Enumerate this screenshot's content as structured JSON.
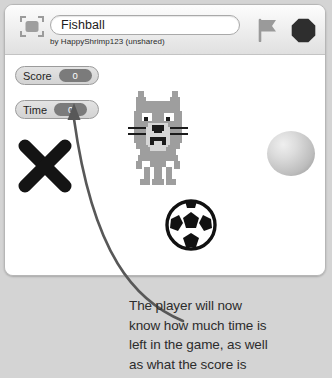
{
  "window": {
    "name": "scratch-project-player"
  },
  "toolbar": {
    "presentation_icon": "presentation-mode-icon",
    "project_title": "Fishball",
    "project_title_placeholder": "Project name",
    "project_author": "by HappyShrimp123 (unshared)",
    "green_flag_icon": "green-flag-icon",
    "stop_icon": "stop-sign-icon",
    "flag_color": "#9a9a9a",
    "stop_color": "#2e2e2e"
  },
  "stage": {
    "background_color": "#ffffff",
    "watchers": [
      {
        "label": "Score",
        "value": "0"
      },
      {
        "label": "Time",
        "value": "0"
      }
    ],
    "sprites": [
      {
        "name": "x-mark-sprite",
        "color": "#141414"
      },
      {
        "name": "pixel-cat-sprite",
        "color": "#9e9e9e"
      },
      {
        "name": "soccer-ball-sprite",
        "color": "#111111"
      },
      {
        "name": "gray-ball-sprite",
        "color": "#c2c2c2"
      }
    ]
  },
  "annotation": {
    "arrow_name": "callout-arrow",
    "arrow_color": "#585858",
    "lines": [
      "The player will now",
      "know how much time is",
      "left in the game, as well",
      "as what the score is"
    ]
  }
}
